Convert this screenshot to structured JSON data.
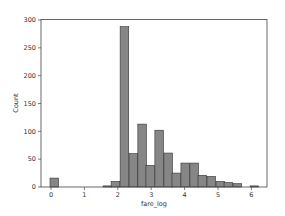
{
  "chart_data": {
    "type": "bar",
    "title": "",
    "xlabel": "fare_log",
    "ylabel": "Count",
    "xlim": [
      -0.3,
      6.46
    ],
    "ylim": [
      0,
      302
    ],
    "xticks": [
      0,
      1,
      2,
      3,
      4,
      5,
      6
    ],
    "yticks": [
      0,
      50,
      100,
      150,
      200,
      250,
      300
    ],
    "grid": false,
    "legend": null,
    "bin_width": 0.257,
    "bar_color": "#808080",
    "edge_color": "#333333",
    "bins": [
      {
        "x": -0.03,
        "count": 16
      },
      {
        "x": 1.56,
        "count": 2
      },
      {
        "x": 1.8,
        "count": 10
      },
      {
        "x": 2.07,
        "count": 288
      },
      {
        "x": 2.34,
        "count": 60
      },
      {
        "x": 2.6,
        "count": 113
      },
      {
        "x": 2.84,
        "count": 39
      },
      {
        "x": 3.11,
        "count": 102
      },
      {
        "x": 3.38,
        "count": 61
      },
      {
        "x": 3.62,
        "count": 25
      },
      {
        "x": 3.89,
        "count": 43
      },
      {
        "x": 4.16,
        "count": 43
      },
      {
        "x": 4.4,
        "count": 21
      },
      {
        "x": 4.67,
        "count": 19
      },
      {
        "x": 4.94,
        "count": 10
      },
      {
        "x": 5.18,
        "count": 8
      },
      {
        "x": 5.45,
        "count": 6
      },
      {
        "x": 5.96,
        "count": 2
      }
    ]
  }
}
